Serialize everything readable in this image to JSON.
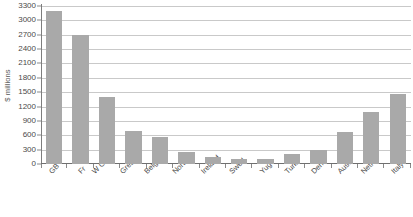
{
  "chart_data": {
    "type": "bar",
    "title": "",
    "xlabel": "",
    "ylabel": "$ millions",
    "ylim": [
      0,
      3300
    ],
    "ytick_step": 300,
    "grid": true,
    "legend": "none",
    "orientation": "vertical",
    "bar_color": "#a9a9a9",
    "gridline_color": "#c9c9c9",
    "axis_color": "#6f6f6f",
    "background_color": "#ffffff",
    "yticks": [
      0,
      300,
      600,
      900,
      1200,
      1500,
      1800,
      2100,
      2400,
      2700,
      3000,
      3300
    ],
    "categories": [
      "GB",
      "Fr",
      "W Germ",
      "Greece",
      "Belg/Lux",
      "Norway",
      "Ireland",
      "Swed",
      "Yug",
      "Turk",
      "Den",
      "Aust",
      "Neths",
      "Italy"
    ],
    "values": [
      3200,
      2700,
      1390,
      685,
      555,
      250,
      140,
      105,
      100,
      215,
      285,
      660,
      1080,
      1470
    ]
  }
}
